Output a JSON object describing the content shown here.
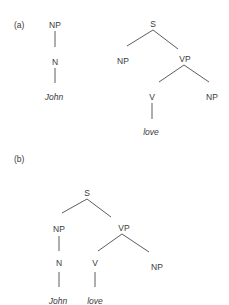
{
  "panels": {
    "a": {
      "label": "(a)",
      "tree1": {
        "root": "NP",
        "child": "N",
        "leaf": "John"
      },
      "tree2": {
        "root": "S",
        "subject": "NP",
        "vp": "VP",
        "verb": "V",
        "object": "NP",
        "leaf_verb": "love"
      }
    },
    "b": {
      "label": "(b)",
      "tree": {
        "root": "S",
        "subject": "NP",
        "subject_child": "N",
        "subject_leaf": "John",
        "vp": "VP",
        "verb": "V",
        "verb_leaf": "love",
        "object": "NP"
      }
    }
  }
}
